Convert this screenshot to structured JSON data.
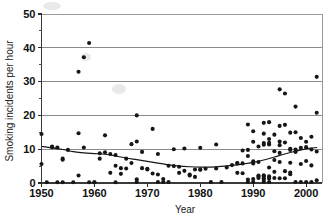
{
  "chart_data": {
    "type": "scatter",
    "title": "",
    "xlabel": "Year",
    "ylabel": "Smoking incidents per hour",
    "xlim": [
      1950,
      2003
    ],
    "ylim": [
      0,
      50
    ],
    "xticks": [
      1950,
      1960,
      1970,
      1980,
      1990,
      2000
    ],
    "xtick_labels": [
      "1950",
      "1960",
      "1970",
      "1980",
      "1990",
      "2000"
    ],
    "yticks": [
      0,
      10,
      20,
      30,
      40,
      50
    ],
    "ytick_labels": [
      "0",
      "10",
      "20",
      "30",
      "40",
      "50"
    ],
    "y_minor_ticks": [
      5,
      15,
      25,
      35,
      45
    ],
    "grid": "horizontal-major",
    "legend": "none",
    "series": [
      {
        "name": "Smoking incidents per hour",
        "marker": "filled-circle",
        "color": "#161616",
        "points": [
          [
            1950,
            14.5
          ],
          [
            1950,
            5.6
          ],
          [
            1951,
            0.2
          ],
          [
            1952,
            10.8
          ],
          [
            1952,
            10.6
          ],
          [
            1953,
            10.5
          ],
          [
            1953,
            0.2
          ],
          [
            1954,
            7.2
          ],
          [
            1954,
            6.9
          ],
          [
            1954,
            0.2
          ],
          [
            1955,
            9.8
          ],
          [
            1956,
            0.2
          ],
          [
            1957,
            14.7
          ],
          [
            1957,
            32.9
          ],
          [
            1957,
            2.2
          ],
          [
            1958,
            37.2
          ],
          [
            1958,
            10.5
          ],
          [
            1959,
            41.4
          ],
          [
            1959,
            0.2
          ],
          [
            1960,
            0.2
          ],
          [
            1960,
            0.2
          ],
          [
            1961,
            8.8
          ],
          [
            1961,
            7.2
          ],
          [
            1962,
            14.1
          ],
          [
            1962,
            9.1
          ],
          [
            1963,
            8.6
          ],
          [
            1963,
            3.0
          ],
          [
            1964,
            8.3
          ],
          [
            1964,
            5.1
          ],
          [
            1964,
            0.2
          ],
          [
            1965,
            4.4
          ],
          [
            1965,
            2.7
          ],
          [
            1966,
            7.2
          ],
          [
            1966,
            4.3
          ],
          [
            1967,
            11.5
          ],
          [
            1967,
            5.9
          ],
          [
            1968,
            20.0
          ],
          [
            1968,
            12.3
          ],
          [
            1968,
            0.3
          ],
          [
            1968,
            1.1
          ],
          [
            1969,
            9.2
          ],
          [
            1969,
            4.4
          ],
          [
            1970,
            4.2
          ],
          [
            1970,
            4.0
          ],
          [
            1971,
            16.0
          ],
          [
            1971,
            2.8
          ],
          [
            1972,
            8.6
          ],
          [
            1972,
            2.5
          ],
          [
            1972,
            0.3
          ],
          [
            1973,
            1.2
          ],
          [
            1973,
            0.3
          ],
          [
            1974,
            5.1
          ],
          [
            1974,
            0.3
          ],
          [
            1975,
            10.0
          ],
          [
            1975,
            5.0
          ],
          [
            1976,
            4.8
          ],
          [
            1976,
            3.0
          ],
          [
            1977,
            10.2
          ],
          [
            1977,
            3.6
          ],
          [
            1978,
            2.5
          ],
          [
            1978,
            2.2
          ],
          [
            1979,
            4.0
          ],
          [
            1979,
            1.8
          ],
          [
            1980,
            10.4
          ],
          [
            1980,
            4.0
          ],
          [
            1980,
            3.9
          ],
          [
            1981,
            4.2
          ],
          [
            1982,
            0.3
          ],
          [
            1983,
            11.4
          ],
          [
            1983,
            4.3
          ],
          [
            1984,
            0.3
          ],
          [
            1985,
            4.6
          ],
          [
            1986,
            5.3
          ],
          [
            1987,
            5.9
          ],
          [
            1987,
            5.8
          ],
          [
            1987,
            3.0
          ],
          [
            1988,
            9.6
          ],
          [
            1988,
            5.8
          ],
          [
            1988,
            2.9
          ],
          [
            1989,
            17.3
          ],
          [
            1989,
            9.8
          ],
          [
            1989,
            8.0
          ],
          [
            1989,
            0.3
          ],
          [
            1989,
            1.0
          ],
          [
            1990,
            15.3
          ],
          [
            1990,
            12.2
          ],
          [
            1990,
            6.4
          ],
          [
            1990,
            5.8
          ],
          [
            1990,
            0.3
          ],
          [
            1990,
            1.2
          ],
          [
            1991,
            10.8
          ],
          [
            1991,
            6.2
          ],
          [
            1991,
            2.2
          ],
          [
            1991,
            1.9
          ],
          [
            1991,
            1.5
          ],
          [
            1992,
            17.8
          ],
          [
            1992,
            14.6
          ],
          [
            1992,
            11.8
          ],
          [
            1992,
            11.3
          ],
          [
            1992,
            2.3
          ],
          [
            1992,
            1.9
          ],
          [
            1992,
            1.4
          ],
          [
            1992,
            0.9
          ],
          [
            1992,
            0.3
          ],
          [
            1993,
            18.0
          ],
          [
            1993,
            13.0
          ],
          [
            1993,
            11.9
          ],
          [
            1993,
            11.4
          ],
          [
            1993,
            4.6
          ],
          [
            1993,
            2.0
          ],
          [
            1993,
            1.3
          ],
          [
            1993,
            0.3
          ],
          [
            1994,
            14.3
          ],
          [
            1994,
            9.4
          ],
          [
            1994,
            6.8
          ],
          [
            1994,
            3.3
          ],
          [
            1994,
            1.5
          ],
          [
            1995,
            27.7
          ],
          [
            1995,
            16.9
          ],
          [
            1995,
            12.3
          ],
          [
            1995,
            11.2
          ],
          [
            1995,
            8.9
          ],
          [
            1995,
            6.2
          ],
          [
            1995,
            1.4
          ],
          [
            1996,
            26.5
          ],
          [
            1996,
            17.2
          ],
          [
            1996,
            12.0
          ],
          [
            1996,
            3.5
          ],
          [
            1996,
            1.4
          ],
          [
            1997,
            14.9
          ],
          [
            1997,
            10.1
          ],
          [
            1997,
            9.8
          ],
          [
            1997,
            6.0
          ],
          [
            1997,
            3.1
          ],
          [
            1997,
            2.6
          ],
          [
            1998,
            22.6
          ],
          [
            1998,
            15.0
          ],
          [
            1998,
            9.9
          ],
          [
            1998,
            9.2
          ],
          [
            1998,
            0.3
          ],
          [
            1999,
            13.3
          ],
          [
            1999,
            10.4
          ],
          [
            1999,
            5.6
          ],
          [
            1999,
            0.3
          ],
          [
            2000,
            12.2
          ],
          [
            2000,
            10.6
          ],
          [
            2000,
            6.5
          ],
          [
            2000,
            0.3
          ],
          [
            2001,
            13.7
          ],
          [
            2001,
            9.9
          ],
          [
            2001,
            5.2
          ],
          [
            2001,
            0.3
          ],
          [
            2002,
            31.4
          ],
          [
            2002,
            20.8
          ],
          [
            2002,
            9.3
          ],
          [
            2002,
            0.8
          ]
        ]
      }
    ],
    "trend_line": {
      "name": "smoothed trend",
      "color": "#161616",
      "points": [
        [
          1950,
          10.8
        ],
        [
          1952,
          10.4
        ],
        [
          1954,
          9.9
        ],
        [
          1956,
          9.3
        ],
        [
          1958,
          8.9
        ],
        [
          1960,
          8.7
        ],
        [
          1962,
          8.5
        ],
        [
          1964,
          8.0
        ],
        [
          1966,
          7.4
        ],
        [
          1968,
          6.9
        ],
        [
          1970,
          6.4
        ],
        [
          1972,
          5.9
        ],
        [
          1974,
          5.4
        ],
        [
          1976,
          5.0
        ],
        [
          1978,
          4.8
        ],
        [
          1980,
          4.7
        ],
        [
          1982,
          4.7
        ],
        [
          1984,
          4.9
        ],
        [
          1986,
          5.2
        ],
        [
          1988,
          5.6
        ],
        [
          1990,
          6.1
        ],
        [
          1992,
          6.8
        ],
        [
          1994,
          7.7
        ],
        [
          1996,
          8.6
        ],
        [
          1998,
          9.4
        ],
        [
          2000,
          10.1
        ],
        [
          2002,
          10.5
        ]
      ]
    }
  }
}
